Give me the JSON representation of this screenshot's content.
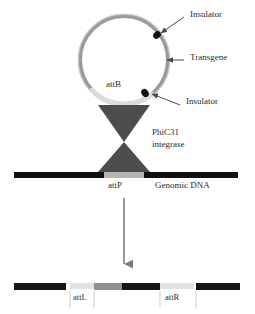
{
  "figure": {
    "type": "diagram"
  },
  "labels": {
    "insulator_top": "Insulator",
    "transgene": "Transgene",
    "insulator_bottom": "Insulator",
    "attB": "attB",
    "integrase_line1": "PhiC31",
    "integrase_line2": "integrase",
    "attP": "attP",
    "genomic_dna": "Genomic DNA",
    "attL": "attL",
    "attR": "attR"
  },
  "colors": {
    "plasmid_ring": "#9a9a9a",
    "plasmid_ring_highlight": "#c9c9c9",
    "insulator_dot": "#1a1a1a",
    "attB_arc": "#d9d9d9",
    "integrase_fill": "#4d4d4d",
    "dna_black": "#111111",
    "attP_gap": "#b5b5b5",
    "arrow_gray": "#7d7d7d",
    "text": "#2b2b2b",
    "att_light": "#e2e2e2",
    "att_mid": "#8e8e8e",
    "att_dark": "#141414"
  },
  "plasmid": {
    "center_x": 124,
    "center_y": 60,
    "radius": 44,
    "ring_width": 4,
    "insulators": [
      {
        "name": "insulator-top-right",
        "angle_deg": -42
      },
      {
        "name": "insulator-bottom-right",
        "angle_deg": 62
      }
    ]
  },
  "genomic_strand": {
    "y": 172,
    "height": 6,
    "left_segment": {
      "x": 14,
      "width": 90
    },
    "attP_segment": {
      "x": 104,
      "width": 40
    },
    "right_segment": {
      "x": 144,
      "width": 94
    }
  },
  "product_strand": {
    "y": 283,
    "height": 7,
    "segments": [
      {
        "name": "genomic-left-arm",
        "x": 14,
        "width": 52,
        "color": "#141414"
      },
      {
        "name": "attL-element",
        "x": 70,
        "width": 24,
        "color": "#e2e2e2"
      },
      {
        "name": "insulator-left",
        "x": 94,
        "width": 28,
        "color": "#8e8e8e"
      },
      {
        "name": "transgene-body",
        "x": 122,
        "width": 38,
        "color": "#141414"
      },
      {
        "name": "attR-element",
        "x": 160,
        "width": 34,
        "color": "#e2e2e2"
      },
      {
        "name": "genomic-right-arm",
        "x": 196,
        "width": 44,
        "color": "#141414"
      }
    ]
  },
  "arrow": {
    "x": 124,
    "y_start": 198,
    "y_end": 272
  },
  "leaders": [
    {
      "name": "leader-insulator-top",
      "from_x": 182,
      "from_y": 18,
      "to_x": 159,
      "to_y": 34
    },
    {
      "name": "leader-transgene",
      "from_x": 180,
      "from_y": 60,
      "to_x": 166,
      "to_y": 60
    },
    {
      "name": "leader-insulator-bottom",
      "from_x": 178,
      "from_y": 103,
      "to_x": 150,
      "to_y": 93
    }
  ]
}
